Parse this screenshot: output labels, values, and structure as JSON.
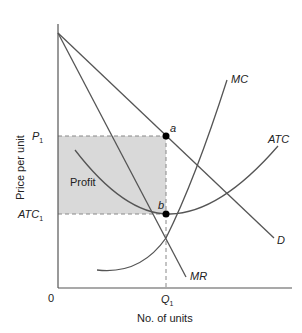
{
  "diagram": {
    "y_axis_label": "Price per unit",
    "x_axis_label": "No. of units",
    "origin_label": "0",
    "price_label": "P",
    "price_sub": "1",
    "atc_label": "ATC",
    "atc_sub": "1",
    "quantity_label": "Q",
    "quantity_sub": "1",
    "profit_label": "Profit",
    "point_a": "a",
    "point_b": "b",
    "curves": {
      "mc": "MC",
      "atc": "ATC",
      "demand": "D",
      "mr": "MR"
    },
    "colors": {
      "line": "#555555",
      "profit_fill": "#d9d9d9",
      "text": "#222222"
    }
  }
}
